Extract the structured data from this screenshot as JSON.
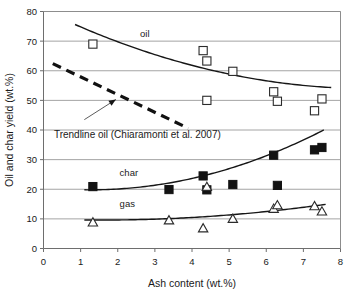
{
  "chart_data": {
    "type": "scatter",
    "title": "",
    "xlabel": "Ash content (wt.%)",
    "ylabel": "Oil and char yield (wt.%)",
    "xlim": [
      0,
      8
    ],
    "ylim": [
      0,
      80
    ],
    "xticks": [
      0,
      1,
      2,
      3,
      4,
      5,
      6,
      7,
      8
    ],
    "yticks": [
      0,
      10,
      20,
      30,
      40,
      50,
      60,
      70,
      80
    ],
    "xtick_labels": [
      "0",
      "1",
      "2",
      "3",
      "4",
      "5",
      "6",
      "7",
      "8"
    ],
    "ytick_labels": [
      "0",
      "10",
      "20",
      "30",
      "40",
      "50",
      "60",
      "70",
      "80"
    ],
    "grid": "horizontal",
    "legend": "inline-labels",
    "series": [
      {
        "name": "oil",
        "marker": "open-square",
        "label": "oil",
        "label_x": 2.6,
        "label_y": 71.5,
        "points": [
          {
            "x": 1.33,
            "y": 69.0
          },
          {
            "x": 4.3,
            "y": 66.8
          },
          {
            "x": 4.4,
            "y": 63.3
          },
          {
            "x": 4.4,
            "y": 50.0
          },
          {
            "x": 5.1,
            "y": 59.8
          },
          {
            "x": 6.2,
            "y": 52.9
          },
          {
            "x": 6.3,
            "y": 49.7
          },
          {
            "x": 7.3,
            "y": 46.5
          },
          {
            "x": 7.5,
            "y": 50.5
          }
        ],
        "fit": {
          "type": "quadratic",
          "x_start": 0.85,
          "x_end": 7.75,
          "coeffs": [
            80.5,
            -6.05,
            0.345
          ]
        }
      },
      {
        "name": "char",
        "marker": "filled-square",
        "label": "char",
        "label_x": 2.05,
        "label_y": 24.6,
        "points": [
          {
            "x": 1.33,
            "y": 20.9
          },
          {
            "x": 3.38,
            "y": 19.9
          },
          {
            "x": 4.3,
            "y": 24.5
          },
          {
            "x": 4.4,
            "y": 19.8
          },
          {
            "x": 5.1,
            "y": 21.6
          },
          {
            "x": 6.2,
            "y": 31.5
          },
          {
            "x": 6.3,
            "y": 21.3
          },
          {
            "x": 7.3,
            "y": 33.3
          },
          {
            "x": 7.5,
            "y": 34.1
          }
        ],
        "fit": {
          "type": "quadratic",
          "x_start": 1.1,
          "x_end": 7.55,
          "coeffs": [
            20.6,
            -1.28,
            0.51
          ]
        }
      },
      {
        "name": "gas",
        "marker": "open-triangle",
        "label": "gas",
        "label_x": 2.05,
        "label_y": 14.0,
        "points": [
          {
            "x": 1.33,
            "y": 9.0
          },
          {
            "x": 3.38,
            "y": 9.7
          },
          {
            "x": 4.3,
            "y": 7.0
          },
          {
            "x": 4.4,
            "y": 21.0
          },
          {
            "x": 5.1,
            "y": 10.2
          },
          {
            "x": 6.2,
            "y": 13.6
          },
          {
            "x": 6.3,
            "y": 14.8
          },
          {
            "x": 7.3,
            "y": 14.5
          },
          {
            "x": 7.5,
            "y": 12.7
          }
        ],
        "fit": {
          "type": "quadratic",
          "x_start": 1.1,
          "x_end": 7.6,
          "coeffs": [
            9.95,
            -0.45,
            0.145
          ]
        }
      }
    ],
    "annotations": [
      {
        "name": "trendline-oil",
        "text": "Trendline oil (Chiaramonti et al. 2007)",
        "text_x": 0.28,
        "text_y": 37.3,
        "style": "dashed",
        "line": {
          "x1": 0.25,
          "y1": 62.4,
          "x2": 3.9,
          "y2": 40.6
        },
        "pointer": {
          "x1": 1.1,
          "y1": 43.5,
          "x2": 1.95,
          "y2": 50.3
        }
      }
    ]
  }
}
